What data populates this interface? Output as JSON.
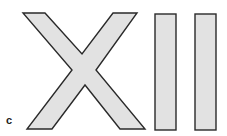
{
  "figure": {
    "panel_label": "c",
    "glyphs": [
      "X",
      "I",
      "I"
    ],
    "roman_numeral": "XII",
    "fill_color": "#e2e2e2",
    "stroke_color": "#2a2a2a"
  }
}
